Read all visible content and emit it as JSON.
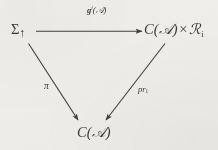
{
  "diagram": {
    "kind": "commutative-diagram",
    "shape": "triangle",
    "background_color": "#f1efeb",
    "ink_color": "#3a3a3a",
    "nodes": [
      {
        "id": "sigma-up",
        "position": "top-left",
        "label": "Σ↑",
        "base": "Σ",
        "subscript": "↑"
      },
      {
        "id": "product",
        "position": "top-right",
        "label": "C(𝒜) × ℛᵢ",
        "left_factor": "C(𝒜)",
        "operator": "×",
        "right_factor": "ℛ",
        "right_subscript": "i"
      },
      {
        "id": "configuration",
        "position": "bottom",
        "label": "C(𝒜)",
        "base": "C",
        "argument": "𝒜"
      }
    ],
    "edges": [
      {
        "id": "top-map",
        "from": "sigma-up",
        "to": "product",
        "direction": "right",
        "label": "𝔤ⁱ(𝒜̂)",
        "label_base": "g",
        "label_superscript": "i",
        "label_argument": "𝒜̂"
      },
      {
        "id": "left-projection",
        "from": "sigma-up",
        "to": "configuration",
        "direction": "down-right",
        "label": "π"
      },
      {
        "id": "right-projection",
        "from": "product",
        "to": "configuration",
        "direction": "down-left",
        "label": "pr₁",
        "label_base": "pr",
        "label_subscript": "1"
      }
    ]
  }
}
